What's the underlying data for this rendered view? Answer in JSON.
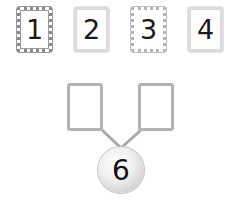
{
  "cards": [
    {
      "label": "1",
      "style": "dark"
    },
    {
      "label": "2",
      "style": "light"
    },
    {
      "label": "3",
      "style": "mid"
    },
    {
      "label": "4",
      "style": "light"
    }
  ],
  "number_bond": {
    "whole": "6",
    "part_left": "",
    "part_right": ""
  }
}
